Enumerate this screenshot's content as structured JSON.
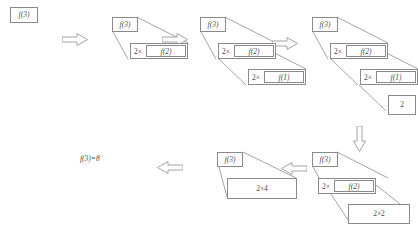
{
  "figure": {
    "text_color": "#4a4a4a",
    "line_color": "#7d7d7d",
    "box_border_color": "#8a8a8a",
    "background": "#ffffff"
  },
  "labels": {
    "f3": "f(3)",
    "f2": "f(2)",
    "f1": "f(1)",
    "times": "2×",
    "base_value": "2",
    "collapse_inner": "2×2",
    "collapse_outer": "2×4",
    "result": "f(3)=8"
  },
  "stages": [
    {
      "id": "stage-1",
      "name": "initial-call",
      "boxes": [
        {
          "name": "box-f3",
          "label": "f(3)"
        }
      ]
    },
    {
      "id": "stage-2",
      "name": "first-expansion",
      "boxes": [
        {
          "name": "box-f3",
          "label": "f(3)"
        },
        {
          "name": "frame-2x-f2",
          "mult": "2×",
          "inner": "f(2)"
        }
      ]
    },
    {
      "id": "stage-3",
      "name": "second-expansion",
      "boxes": [
        {
          "name": "box-f3",
          "label": "f(3)"
        },
        {
          "name": "frame-2x-f2",
          "mult": "2×",
          "inner": "f(2)"
        },
        {
          "name": "frame-2x-f1",
          "mult": "2×",
          "inner": "f(1)"
        }
      ]
    },
    {
      "id": "stage-4",
      "name": "base-case-reached",
      "boxes": [
        {
          "name": "box-f3",
          "label": "f(3)"
        },
        {
          "name": "frame-2x-f2",
          "mult": "2×",
          "inner": "f(2)"
        },
        {
          "name": "frame-2x-f1",
          "mult": "2×",
          "inner": "f(1)"
        },
        {
          "name": "box-base-2",
          "label": "2"
        }
      ]
    },
    {
      "id": "stage-5",
      "name": "first-collapse",
      "boxes": [
        {
          "name": "box-f3",
          "label": "f(3)"
        },
        {
          "name": "frame-2x-f2",
          "mult": "2×",
          "inner": "f(2)"
        },
        {
          "name": "box-2x2",
          "label": "2×2"
        }
      ]
    },
    {
      "id": "stage-6",
      "name": "second-collapse",
      "boxes": [
        {
          "name": "box-f3",
          "label": "f(3)"
        },
        {
          "name": "box-2x4",
          "label": "2×4"
        }
      ]
    },
    {
      "id": "stage-7",
      "name": "final-result",
      "boxes": [
        {
          "name": "result-text",
          "label": "f(3)=8"
        }
      ]
    }
  ],
  "arrows": [
    {
      "name": "arrow-stage1-to-stage2",
      "direction": "right"
    },
    {
      "name": "arrow-stage2-to-stage3",
      "direction": "right"
    },
    {
      "name": "arrow-stage3-to-stage4",
      "direction": "right"
    },
    {
      "name": "arrow-stage4-to-stage5",
      "direction": "down"
    },
    {
      "name": "arrow-stage5-to-stage6",
      "direction": "left"
    },
    {
      "name": "arrow-stage6-to-result",
      "direction": "left"
    }
  ]
}
